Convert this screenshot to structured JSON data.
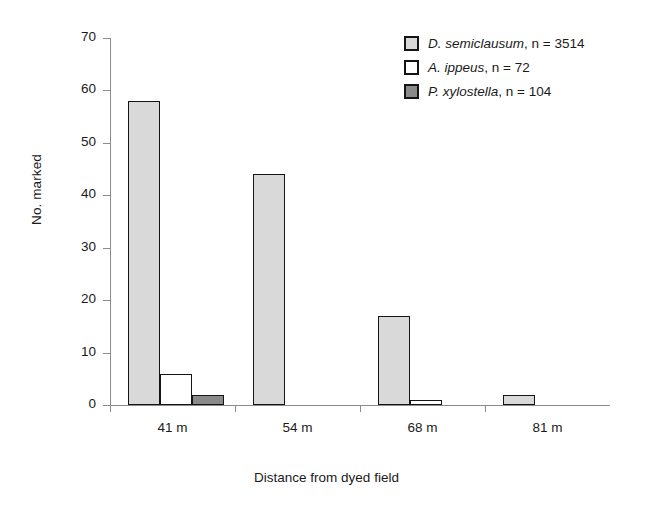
{
  "chart_data": {
    "type": "bar",
    "title": "",
    "subtitle": "",
    "xlabel": "Distance from dyed field",
    "ylabel": "No. marked",
    "categories": [
      "41 m",
      "54 m",
      "68 m",
      "81 m"
    ],
    "series": [
      {
        "name": "D. semiclausum, n = 3514",
        "species": "D. semiclausum",
        "n_text": ", n = 3514",
        "color": "#d9d9d9",
        "values": [
          58,
          44,
          17,
          2
        ]
      },
      {
        "name": "A. ippeus, n = 72",
        "species": "A. ippeus",
        "n_text": ", n = 72",
        "color": "#ffffff",
        "values": [
          6,
          0,
          1,
          0
        ]
      },
      {
        "name": "P. xylostella, n = 104",
        "species": "P. xylostella",
        "n_text": ", n = 104",
        "color": "#8a8a8a",
        "values": [
          2,
          0,
          0,
          0
        ]
      }
    ],
    "ylim": [
      0,
      70
    ],
    "ytick_values": [
      0,
      10,
      20,
      30,
      40,
      50,
      60,
      70
    ],
    "ytick_labels": [
      "0",
      "10",
      "20",
      "30",
      "40",
      "50",
      "60",
      "70"
    ],
    "grid": false,
    "legend_position": "top-right",
    "bar_outline_color": "#141414",
    "axis_color": "#8c8c8c"
  }
}
